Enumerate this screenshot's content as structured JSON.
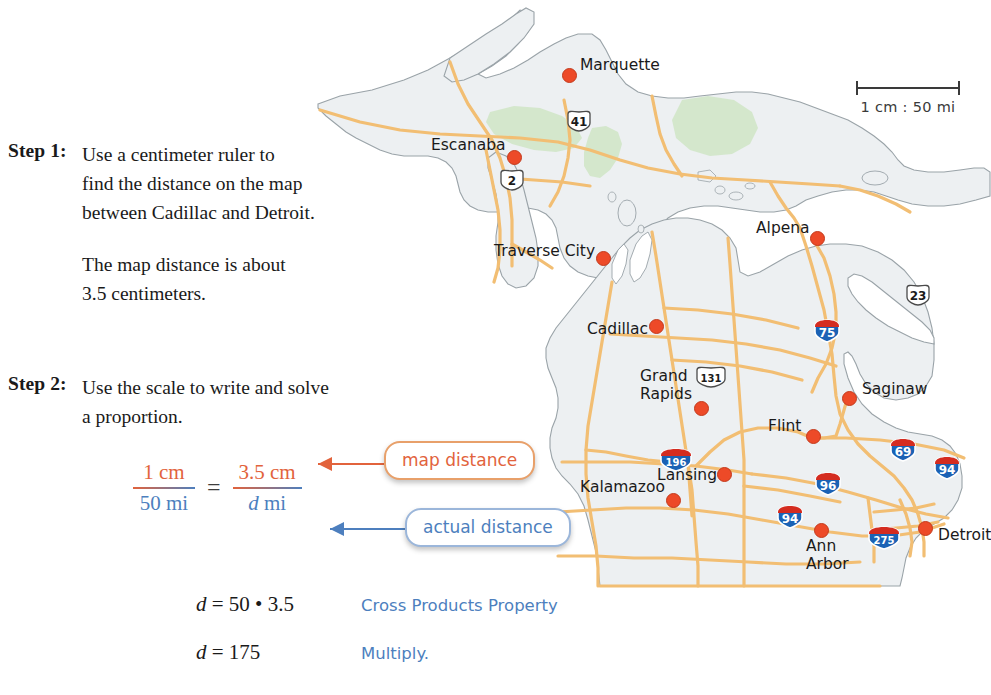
{
  "steps": [
    {
      "label": "Step 1:",
      "lines": [
        "Use a centimeter ruler to",
        "find the distance on the map",
        "between Cadillac and Detroit."
      ]
    },
    {
      "label": "",
      "lines": [
        "The map distance is about",
        "3.5 centimeters."
      ]
    },
    {
      "label": "Step 2:",
      "lines": [
        "Use the scale to write and solve",
        "a proportion."
      ]
    }
  ],
  "proportion": {
    "left_numerator": "1 cm",
    "left_denominator": "50 mi",
    "equals": "=",
    "right_numerator": "3.5 cm",
    "right_denominator_var": "d",
    "right_denominator_unit": "mi"
  },
  "callouts": {
    "map_distance": "map distance",
    "actual_distance": "actual distance"
  },
  "solution": [
    {
      "equation": "d = 50 • 3.5",
      "reason": "Cross Products Property"
    },
    {
      "equation": "d = 175",
      "reason": "Multiply."
    }
  ],
  "map": {
    "scale_text": "1 cm : 50 mi",
    "cities": [
      {
        "name": "Marquette",
        "x": 568,
        "y": 74
      },
      {
        "name": "Escanaba",
        "x": 513,
        "y": 156
      },
      {
        "name": "Traverse City",
        "x": 602,
        "y": 257
      },
      {
        "name": "Alpena",
        "x": 816,
        "y": 237
      },
      {
        "name": "Cadillac",
        "x": 655,
        "y": 325
      },
      {
        "name": "Saginaw",
        "x": 848,
        "y": 397
      },
      {
        "name": "Grand Rapids",
        "x": 700,
        "y": 407
      },
      {
        "name": "Flint",
        "x": 812,
        "y": 435
      },
      {
        "name": "Lansing",
        "x": 723,
        "y": 473
      },
      {
        "name": "Kalamazoo",
        "x": 672,
        "y": 499
      },
      {
        "name": "Ann Arbor",
        "x": 820,
        "y": 529
      },
      {
        "name": "Detroit",
        "x": 924,
        "y": 527
      }
    ],
    "highways": [
      {
        "number": "41",
        "type": "us",
        "x": 579,
        "y": 121
      },
      {
        "number": "2",
        "type": "us",
        "x": 512,
        "y": 180
      },
      {
        "number": "23",
        "type": "us",
        "x": 918,
        "y": 295
      },
      {
        "number": "131",
        "type": "us",
        "x": 711,
        "y": 377
      },
      {
        "number": "75",
        "type": "interstate",
        "x": 827,
        "y": 331
      },
      {
        "number": "196",
        "type": "interstate",
        "x": 676,
        "y": 460
      },
      {
        "number": "96",
        "type": "interstate",
        "x": 828,
        "y": 484
      },
      {
        "number": "69",
        "type": "interstate",
        "x": 903,
        "y": 450
      },
      {
        "number": "94",
        "type": "interstate",
        "x": 947,
        "y": 468
      },
      {
        "number": "94",
        "type": "interstate",
        "x": 790,
        "y": 517
      },
      {
        "number": "275",
        "type": "interstate",
        "x": 884,
        "y": 538
      }
    ]
  },
  "colors": {
    "orange": "#E2633C",
    "blue": "#4D7FBE",
    "city_dot": "#ED4A28",
    "road": "#F5C173",
    "land": "#EDF0F2",
    "forest": "#CFE5C6",
    "interstate_blue": "#1B62B5",
    "interstate_red": "#D42C20"
  }
}
